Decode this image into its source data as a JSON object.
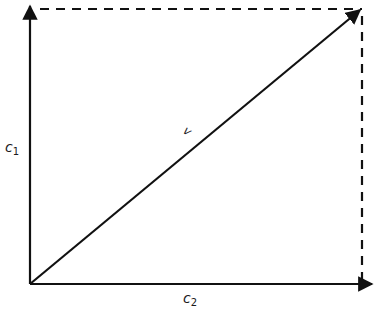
{
  "diagram": {
    "type": "vector-decomposition",
    "labels": {
      "vertical_axis": {
        "base": "c",
        "sub": "1"
      },
      "horizontal_axis": {
        "base": "c",
        "sub": "2"
      },
      "vector": "v"
    },
    "geometry": {
      "origin": [
        30,
        284
      ],
      "vertical_axis_end": [
        30,
        8
      ],
      "horizontal_axis_end": [
        371,
        284
      ],
      "vector_end": [
        359,
        11
      ],
      "dashed_top": {
        "from": [
          40,
          9
        ],
        "to": [
          362,
          9
        ]
      },
      "dashed_right": {
        "from": [
          362,
          14
        ],
        "to": [
          362,
          280
        ]
      }
    },
    "colors": {
      "stroke": "#111111",
      "background": "#ffffff"
    }
  }
}
